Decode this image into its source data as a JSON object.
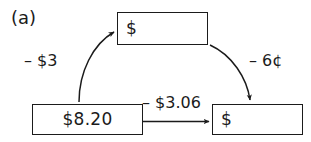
{
  "figure": {
    "label": "(a)",
    "background_color": "#ffffff",
    "ink_color": "#1b1b1b"
  },
  "boxes": {
    "top": {
      "value": "$",
      "filled": false
    },
    "bottom_left": {
      "value": "$8.20",
      "filled": true
    },
    "bottom_right": {
      "value": "$",
      "filled": false
    }
  },
  "arrows": {
    "left_curve": {
      "label": "– $3",
      "from": "bottom_left",
      "to": "top",
      "style": "curved"
    },
    "right_curve": {
      "label": "– 6¢",
      "from": "top",
      "to": "bottom_right",
      "style": "curved"
    },
    "bottom_straight": {
      "label": "– $3.06",
      "from": "bottom_left",
      "to": "bottom_right",
      "style": "straight"
    }
  }
}
